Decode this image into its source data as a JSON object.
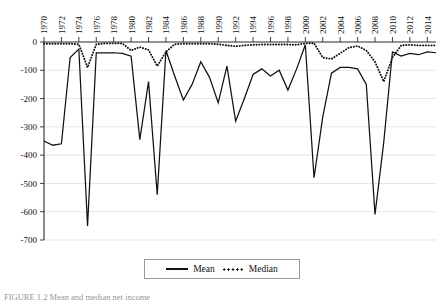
{
  "figure": {
    "caption": "FIGURE 1.2   Mean and median net income"
  },
  "legend": {
    "position": "bottom-center",
    "entries": [
      {
        "label": "Mean",
        "style": "solid",
        "icon": "line-solid-icon"
      },
      {
        "label": "Median",
        "style": "dotted",
        "icon": "line-dotted-icon"
      }
    ]
  },
  "chart_data": {
    "type": "line",
    "title": "",
    "subtitle": "",
    "xlabel": "",
    "ylabel": "",
    "grid": true,
    "xlim": [
      1970,
      2015
    ],
    "ylim": [
      -700,
      0
    ],
    "ytick_labels": [
      "0",
      "-100",
      "-200",
      "-300",
      "-400",
      "-500",
      "-600",
      "-700"
    ],
    "ytick_values": [
      0,
      -100,
      -200,
      -300,
      -400,
      -500,
      -600,
      -700
    ],
    "xtick_labels": [
      "1970",
      "1972",
      "1974",
      "1976",
      "1978",
      "1980",
      "1982",
      "1984",
      "1986",
      "1988",
      "1990",
      "1992",
      "1994",
      "1996",
      "1998",
      "2000",
      "2002",
      "2004",
      "2006",
      "2008",
      "2010",
      "2012",
      "2014"
    ],
    "xtick_values": [
      1970,
      1972,
      1974,
      1976,
      1978,
      1980,
      1982,
      1984,
      1986,
      1988,
      1990,
      1992,
      1994,
      1996,
      1998,
      2000,
      2002,
      2004,
      2006,
      2008,
      2010,
      2012,
      2014
    ],
    "x": [
      1970,
      1971,
      1972,
      1973,
      1974,
      1975,
      1976,
      1977,
      1978,
      1979,
      1980,
      1981,
      1982,
      1983,
      1984,
      1985,
      1986,
      1987,
      1988,
      1989,
      1990,
      1991,
      1992,
      1993,
      1994,
      1995,
      1996,
      1997,
      1998,
      1999,
      2000,
      2001,
      2002,
      2003,
      2004,
      2005,
      2006,
      2007,
      2008,
      2009,
      2010,
      2011,
      2012,
      2013,
      2014,
      2015
    ],
    "series": [
      {
        "name": "Mean",
        "style": "solid",
        "color": "#111111",
        "values": [
          -350,
          -365,
          -360,
          -55,
          -25,
          -650,
          -38,
          -38,
          -38,
          -40,
          -50,
          -345,
          -140,
          -540,
          -30,
          -120,
          -205,
          -150,
          -70,
          -125,
          -215,
          -85,
          -280,
          -200,
          -115,
          -95,
          -120,
          -100,
          -170,
          -95,
          -10,
          -480,
          -265,
          -110,
          -90,
          -90,
          -95,
          -150,
          -610,
          -355,
          -35,
          -50,
          -40,
          -45,
          -35,
          -38
        ]
      },
      {
        "name": "Median",
        "style": "dotted",
        "color": "#111111",
        "values": [
          -6,
          -6,
          -6,
          -6,
          -8,
          -90,
          -8,
          -5,
          -5,
          -5,
          -30,
          -18,
          -28,
          -85,
          -35,
          -8,
          -6,
          -6,
          -6,
          -6,
          -8,
          -12,
          -15,
          -12,
          -10,
          -9,
          -9,
          -9,
          -9,
          -10,
          -5,
          -4,
          -55,
          -60,
          -40,
          -20,
          -14,
          -30,
          -70,
          -140,
          -55,
          -12,
          -10,
          -12,
          -12,
          -12
        ]
      }
    ]
  }
}
